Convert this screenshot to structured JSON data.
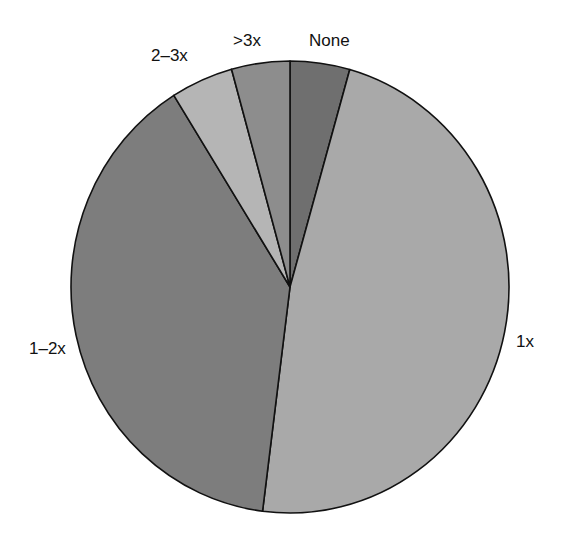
{
  "chart_data": {
    "type": "pie",
    "title": "",
    "categories": [
      "None",
      "1x",
      "1-2x",
      "2-3x",
      ">3x"
    ],
    "values": [
      4.4,
      47.6,
      39.1,
      4.6,
      4.3
    ],
    "start_angle_deg": 0,
    "direction": "clockwise",
    "colors": [
      "#6f6f6f",
      "#a9a9a9",
      "#7d7d7d",
      "#b5b5b5",
      "#8d8d8d"
    ],
    "legend": "none",
    "labels_outside": true
  },
  "labels": {
    "none": "None",
    "one_x": "1x",
    "one_two_x": "1–2x",
    "two_three_x": "2–3x",
    "gt_three_x": ">3x"
  },
  "geometry": {
    "cx": 290,
    "cy": 287,
    "rx": 219,
    "ry": 226
  }
}
